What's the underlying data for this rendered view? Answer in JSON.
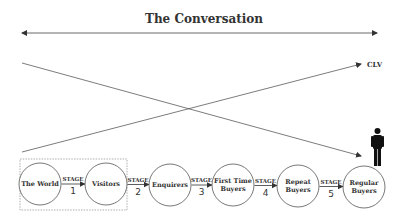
{
  "title": "The Conversation",
  "clv_label": "CLV",
  "colors": {
    "line": "#444444",
    "text": "#333333",
    "figure": "#111111"
  },
  "nodes": [
    {
      "id": "world",
      "lines": [
        "The World"
      ],
      "cx": 40,
      "cy": 184
    },
    {
      "id": "visitors",
      "lines": [
        "Visitors"
      ],
      "cx": 106,
      "cy": 184
    },
    {
      "id": "enquirers",
      "lines": [
        "Enquirers"
      ],
      "cx": 170,
      "cy": 185
    },
    {
      "id": "first-time-buyers",
      "lines": [
        "First Time",
        "Buyers"
      ],
      "cx": 233,
      "cy": 185
    },
    {
      "id": "repeat-buyers",
      "lines": [
        "Repeat",
        "Buyers"
      ],
      "cx": 298,
      "cy": 186
    },
    {
      "id": "regular-buyers",
      "lines": [
        "Regular",
        "Buyers"
      ],
      "cx": 364,
      "cy": 187
    }
  ],
  "stages": [
    {
      "label": "STAGE",
      "num": "1"
    },
    {
      "label": "STAGE",
      "num": "2"
    },
    {
      "label": "STAGE",
      "num": "3"
    },
    {
      "label": "STAGE",
      "num": "4"
    },
    {
      "label": "STAGE",
      "num": "5"
    }
  ]
}
